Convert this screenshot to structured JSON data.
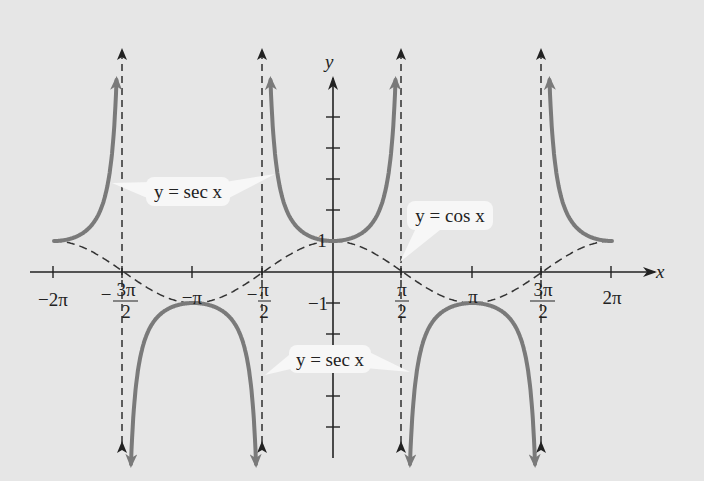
{
  "chart_data": {
    "type": "line",
    "title": "",
    "xlabel": "x",
    "ylabel": "y",
    "x_ticks": [
      "−2π",
      "−3π/2",
      "−π",
      "−π/2",
      "π/2",
      "π",
      "3π/2",
      "2π"
    ],
    "x_tick_values": [
      -6.2832,
      -4.7124,
      -3.1416,
      -1.5708,
      1.5708,
      3.1416,
      4.7124,
      6.2832
    ],
    "y_tick_labels": [
      "1",
      "−1"
    ],
    "y_tick_values": [
      1,
      -1
    ],
    "xlim": [
      -6.2832,
      6.2832
    ],
    "ylim": [
      -5,
      5
    ],
    "asymptotes": [
      -4.7124,
      -1.5708,
      1.5708,
      4.7124
    ],
    "series": [
      {
        "name": "y = sec x",
        "style": "solid",
        "color": "#7a7a7a",
        "x": [
          -6.2832,
          -5.5,
          -5.0,
          0.0,
          1.0,
          3.1416,
          4.0,
          6.2832
        ],
        "y": [
          1,
          1.41,
          3.53,
          1,
          1.85,
          -1,
          -1.53,
          1
        ]
      },
      {
        "name": "y = cos x",
        "style": "dashed",
        "color": "#333333",
        "x": [
          -6.2832,
          -4.7124,
          -3.1416,
          -1.5708,
          0,
          1.5708,
          3.1416,
          4.7124,
          6.2832
        ],
        "y": [
          1,
          0,
          -1,
          0,
          1,
          0,
          -1,
          0,
          1
        ]
      }
    ],
    "annotations": [
      {
        "text": "y = sec x",
        "position": "upper-left"
      },
      {
        "text": "y = cos x",
        "position": "right of y-axis"
      },
      {
        "text": "y = sec x",
        "position": "lower-middle"
      }
    ],
    "grid": false,
    "legend": "none"
  },
  "labels": {
    "x_axis": "x",
    "y_axis": "y",
    "neg_2pi": "−2π",
    "neg_pi": "−π",
    "pi": "π",
    "two_pi": "2π",
    "minus": "−",
    "three_pi": "3π",
    "pi_num": "π",
    "den_2": "2",
    "one": "1",
    "neg_one": "−1",
    "sec_upper": "y = sec x",
    "cos": "y = cos x",
    "sec_lower": "y = sec x"
  },
  "colors": {
    "background": "#e6e6e6",
    "sec_curve": "#7a7a7a",
    "axis": "#222222",
    "callout_bg": "#f7f7f7"
  }
}
